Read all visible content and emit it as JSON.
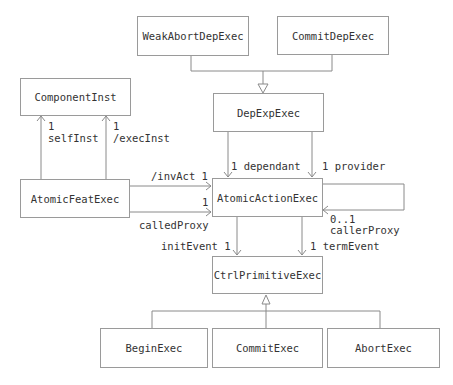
{
  "classes": {
    "weak_abort_dep_exec": "WeakAbortDepExec",
    "commit_dep_exec": "CommitDepExec",
    "dep_exp_exec": "DepExpExec",
    "component_inst": "ComponentInst",
    "atomic_feat_exec": "AtomicFeatExec",
    "atomic_action_exec": "AtomicActionExec",
    "ctrl_primitive_exec": "CtrlPrimitiveExec",
    "begin_exec": "BeginExec",
    "commit_exec": "CommitExec",
    "abort_exec": "AbortExec"
  },
  "labels": {
    "self_inst_mult": "1",
    "self_inst_role": "selfInst",
    "exec_inst_mult": "1",
    "exec_inst_role": "/execInst",
    "inv_act": "/invAct 1",
    "called_proxy_mult": "1",
    "called_proxy_role": "calledProxy",
    "dependant": "1 dependant",
    "provider": "1 provider",
    "caller_proxy_mult": "0..1",
    "caller_proxy_role": "callerProxy",
    "init_event": "initEvent 1",
    "term_event": "1 termEvent"
  },
  "colors": {
    "line": "#8a8a8a",
    "border": "#9a9a9a",
    "text": "#333333"
  }
}
